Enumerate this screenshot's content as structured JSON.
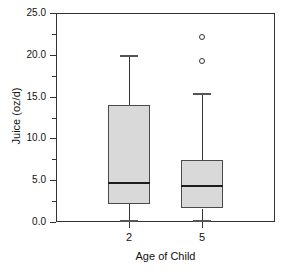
{
  "chart_data": {
    "type": "box",
    "title": "",
    "xlabel": "Age of Child",
    "ylabel": "Juice (oz/d)",
    "ylim": [
      0.0,
      25.0
    ],
    "yticks": [
      "0.0",
      "5.0",
      "10.0",
      "15.0",
      "20.0",
      "25.0"
    ],
    "ytick_values": [
      0.0,
      5.0,
      10.0,
      15.0,
      20.0,
      25.0
    ],
    "yminor_ticks": [
      2.5,
      7.5,
      12.5,
      17.5,
      22.5
    ],
    "grid": false,
    "legend": "none",
    "categories": [
      "2",
      "5"
    ],
    "boxes": [
      {
        "category": "2",
        "whisker_low": 0.2,
        "q1": 2.1,
        "median": 4.8,
        "q3": 14.0,
        "whisker_high": 20.0,
        "outliers": []
      },
      {
        "category": "5",
        "whisker_low": 0.2,
        "q1": 1.6,
        "median": 4.4,
        "q3": 7.4,
        "whisker_high": 15.4,
        "outliers": [
          19.2,
          22.1
        ]
      }
    ],
    "box_fill_color": "#d9d9d9",
    "box_edge_color": "#4a4a4a",
    "median_color": "#1d1d1d",
    "axis_color": "#333333"
  }
}
